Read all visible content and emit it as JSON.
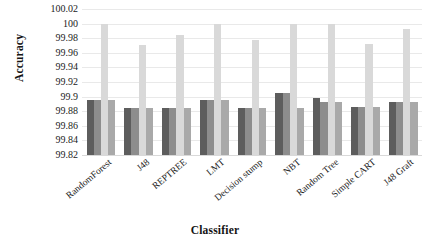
{
  "chart_data": {
    "type": "bar",
    "title": "",
    "xlabel": "Classifier",
    "ylabel": "Accuracy",
    "ylim": [
      99.82,
      100.02
    ],
    "ytick_labels": [
      "100.02",
      "100",
      "99.98",
      "99.96",
      "99.94",
      "99.92",
      "99.9",
      "99.88",
      "99.86",
      "99.84",
      "99.82"
    ],
    "ytick_values": [
      100.02,
      100,
      99.98,
      99.96,
      99.94,
      99.92,
      99.9,
      99.88,
      99.86,
      99.84,
      99.82
    ],
    "grid": true,
    "legend": "none",
    "categories": [
      "RandomForest",
      "J48",
      "REPTREE",
      "LMT",
      "Decision stump",
      "NBT",
      "Random Tree",
      "Simple CART",
      "J48 Graft"
    ],
    "series": [
      {
        "name": "series-1",
        "color": "#5d5d5d",
        "values": [
          99.895,
          99.885,
          99.885,
          99.895,
          99.884,
          99.905,
          99.898,
          99.886,
          99.893
        ]
      },
      {
        "name": "series-2",
        "color": "#8d8d8d",
        "values": [
          99.895,
          99.885,
          99.885,
          99.895,
          99.884,
          99.905,
          99.893,
          99.886,
          99.893
        ]
      },
      {
        "name": "series-3",
        "color": "#d9d9d9",
        "values": [
          100.0,
          99.971,
          99.985,
          100.0,
          99.978,
          100.0,
          100.0,
          99.972,
          99.993
        ]
      },
      {
        "name": "series-4",
        "color": "#a9a9a9",
        "values": [
          99.895,
          99.885,
          99.885,
          99.895,
          99.884,
          99.884,
          99.893,
          99.886,
          99.893
        ]
      }
    ]
  }
}
